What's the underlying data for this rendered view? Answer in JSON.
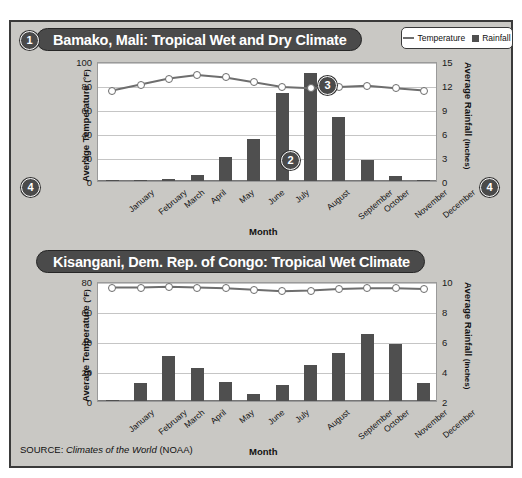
{
  "source_note": {
    "prefix": "SOURCE: ",
    "italic": "Climates of the World",
    "suffix": " (NOAA)"
  },
  "legend": {
    "temperature_label": "Temperature",
    "rainfall_label": "Rainfall",
    "line_color": "#6e6e6e",
    "bar_color": "#4f4f4f"
  },
  "callouts": {
    "one": "1",
    "two": "2",
    "three": "3",
    "four_left": "4",
    "four_right": "4"
  },
  "chart_data": [
    {
      "type": "bar",
      "id": "bamako",
      "title": "Bamako, Mali: Tropical Wet and Dry Climate",
      "xlabel": "Month",
      "ylabel_left": "Average Temperature",
      "ylabel_left_unit": "(°F)",
      "ylabel_right": "Average Rainfall",
      "ylabel_right_unit": "(inches)",
      "categories": [
        "January",
        "February",
        "March",
        "April",
        "May",
        "June",
        "July",
        "August",
        "September",
        "October",
        "November",
        "December"
      ],
      "ylim_left": [
        0,
        100
      ],
      "yticks_left": [
        0,
        20,
        40,
        60,
        80,
        100
      ],
      "ylim_right": [
        0,
        15
      ],
      "yticks_right": [
        0,
        3,
        6,
        9,
        12,
        15
      ],
      "grid": true,
      "legend_position": "top-right",
      "series": [
        {
          "name": "Rainfall",
          "unit": "inches",
          "axis": "right",
          "render": "bar",
          "values": [
            0.05,
            0.05,
            0.2,
            0.7,
            3.0,
            5.2,
            11.0,
            13.5,
            8.0,
            2.6,
            0.6,
            0.1
          ]
        },
        {
          "name": "Temperature",
          "unit": "°F",
          "axis": "left",
          "render": "line",
          "values": [
            77,
            82,
            87,
            90,
            88,
            84,
            80,
            79,
            80,
            81,
            79,
            77
          ]
        }
      ]
    },
    {
      "type": "bar",
      "id": "kisangani",
      "title": "Kisangani, Dem. Rep. of Congo: Tropical Wet Climate",
      "xlabel": "Month",
      "ylabel_left": "Average Temperature",
      "ylabel_left_unit": "(°F)",
      "ylabel_right": "Average Rainfall",
      "ylabel_right_unit": "(inches)",
      "categories": [
        "January",
        "February",
        "March",
        "April",
        "May",
        "June",
        "July",
        "August",
        "September",
        "October",
        "November",
        "December"
      ],
      "ylim_left": [
        0,
        80
      ],
      "yticks_left": [
        0,
        20,
        40,
        60,
        80
      ],
      "ylim_right": [
        2,
        10
      ],
      "yticks_right": [
        2,
        4,
        6,
        8,
        10
      ],
      "grid": true,
      "legend_position": "top-right",
      "series": [
        {
          "name": "Rainfall",
          "unit": "inches",
          "axis": "right",
          "render": "bar",
          "values": [
            2.1,
            3.2,
            5.0,
            4.2,
            3.3,
            2.5,
            3.1,
            4.4,
            5.2,
            6.5,
            5.8,
            3.2
          ]
        },
        {
          "name": "Temperature",
          "unit": "°F",
          "axis": "left",
          "render": "line",
          "values": [
            77,
            77,
            77.5,
            77,
            76.5,
            75.5,
            74.5,
            75,
            76,
            76.5,
            76.5,
            76
          ]
        }
      ]
    }
  ]
}
